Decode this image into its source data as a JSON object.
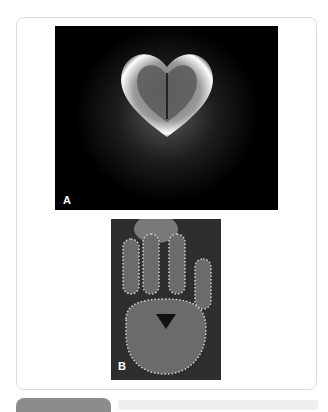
{
  "figure": {
    "panels": [
      {
        "label": "A",
        "description": "Kirlian photograph of a glowing heart-shaped leaf on black background"
      },
      {
        "label": "B",
        "description": "Kirlian photograph of a hand print with corona discharge outline"
      }
    ]
  },
  "colors": {
    "card_border": "#dcdcdc",
    "panel_a_bg": "#000000",
    "panel_b_bg": "#3a3a3a",
    "bottom_pill": "#8c8c8c",
    "bottom_bar": "#efefef"
  }
}
